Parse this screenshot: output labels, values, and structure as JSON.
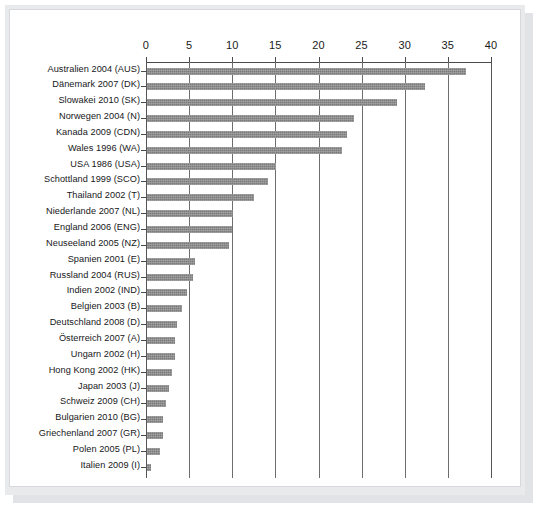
{
  "chart_data": {
    "type": "bar",
    "orientation": "horizontal",
    "title": "",
    "xlabel": "",
    "ylabel": "",
    "xlim": [
      0,
      40
    ],
    "xticks": [
      0,
      5,
      10,
      15,
      20,
      25,
      30,
      35,
      40
    ],
    "tick_labels": [
      "0",
      "5",
      "10",
      "15",
      "20",
      "25",
      "30",
      "35",
      "40"
    ],
    "grid": true,
    "grid_axis": "x",
    "legend": "none",
    "bar_color": "#7b7b7b",
    "background_color": "#ffffff",
    "frame_color": "#e9eaec",
    "categories": [
      "Australien 2004 (AUS)",
      "Dänemark 2007 (DK)",
      "Slowakei 2010 (SK)",
      "Norwegen 2004 (N)",
      "Kanada 2009 (CDN)",
      "Wales 1996 (WA)",
      "USA 1986 (USA)",
      "Schottland 1999 (SCO)",
      "Thailand 2002 (T)",
      "Niederlande 2007 (NL)",
      "England 2006 (ENG)",
      "Neuseeland 2005 (NZ)",
      "Spanien 2001 (E)",
      "Russland 2004 (RUS)",
      "Indien 2002 (IND)",
      "Belgien 2003 (B)",
      "Deutschland 2008 (D)",
      "Österreich 2007 (A)",
      "Ungarn 2002 (H)",
      "Hong Kong 2002 (HK)",
      "Japan 2003 (J)",
      "Schweiz 2009 (CH)",
      "Bulgarien 2010 (BG)",
      "Griechenland 2007 (GR)",
      "Polen 2005 (PL)",
      "Italien 2009 (I)"
    ],
    "values": [
      37.0,
      32.2,
      29.0,
      24.0,
      23.2,
      22.6,
      15.0,
      14.0,
      12.4,
      10.0,
      9.9,
      9.5,
      5.6,
      5.3,
      4.6,
      4.0,
      3.5,
      3.3,
      3.2,
      2.9,
      2.5,
      2.2,
      1.9,
      1.8,
      1.5,
      0.5
    ]
  }
}
